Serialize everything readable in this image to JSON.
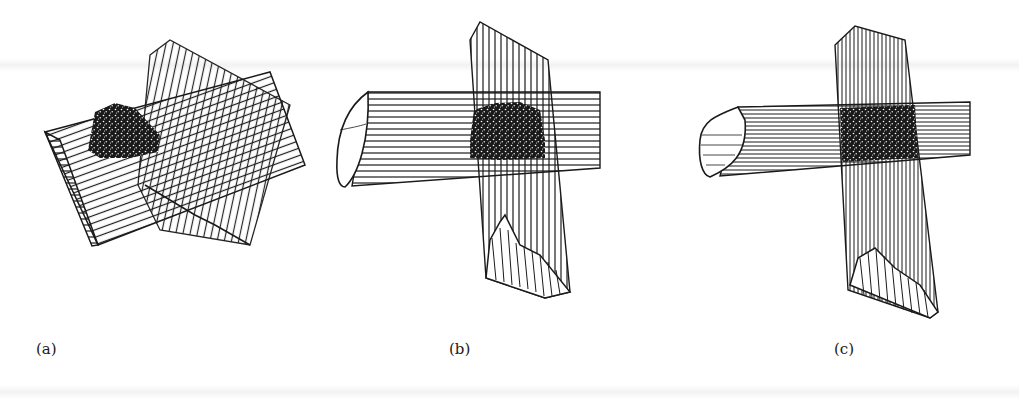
{
  "figure": {
    "panels": [
      {
        "id": "a",
        "label": "(a)",
        "label_x": 36,
        "description": "two crossing hatched prismatic rods at oblique angle with dark mottled intersection region"
      },
      {
        "id": "b",
        "label": "(b)",
        "label_x": 449,
        "description": "horizontal rod crossed by vertical rod, dark mottled intersection region"
      },
      {
        "id": "c",
        "label": "(c)",
        "label_x": 834,
        "description": "horizontal rod crossed by vertical rod, dark mottled intersection region, denser shading"
      }
    ],
    "colors": {
      "ink": "#1a1a1a",
      "paper": "#ffffff"
    }
  }
}
